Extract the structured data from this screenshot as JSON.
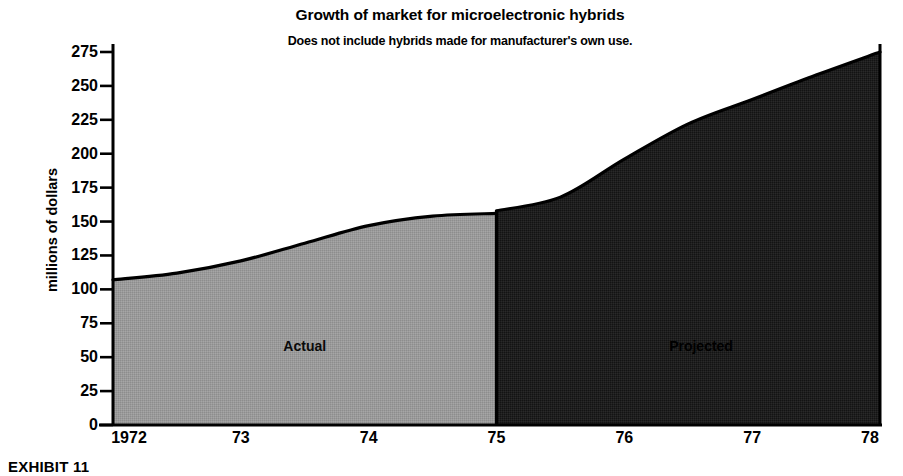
{
  "chart_data": {
    "type": "area",
    "title": "Growth of market for microelectronic hybrids",
    "subtitle": "Does not include hybrids made for manufacturer's own use.",
    "xlabel": "",
    "ylabel": "millions of dollars",
    "xlim": [
      1972,
      1978
    ],
    "ylim": [
      0,
      275
    ],
    "grid": false,
    "legend_position": "inside-plot",
    "x_tick_labels": [
      "1972",
      "73",
      "74",
      "75",
      "76",
      "77",
      "78"
    ],
    "x_tick_values": [
      1972,
      1973,
      1974,
      1975,
      1976,
      1977,
      1978
    ],
    "y_tick_labels": [
      "0",
      "25",
      "50",
      "75",
      "100",
      "125",
      "150",
      "175",
      "200",
      "225",
      "250",
      "275"
    ],
    "y_tick_values": [
      0,
      25,
      50,
      75,
      100,
      125,
      150,
      175,
      200,
      225,
      250,
      275
    ],
    "series": [
      {
        "name": "Actual",
        "fill_color": "#9a9a9a",
        "x": [
          1972,
          1972.5,
          1973,
          1973.5,
          1974,
          1974.5,
          1975
        ],
        "values": [
          107,
          112,
          121,
          134,
          147,
          154,
          156
        ]
      },
      {
        "name": "Projected",
        "fill_color": "#1e1e1e",
        "x": [
          1975,
          1975.5,
          1976,
          1976.5,
          1977,
          1977.5,
          1978
        ],
        "values": [
          158,
          168,
          196,
          222,
          240,
          258,
          275
        ]
      }
    ],
    "annotations": [
      {
        "text": "Actual",
        "x": 1973.5,
        "y": 58
      },
      {
        "text": "Projected",
        "x": 1976.6,
        "y": 58
      }
    ]
  },
  "caption": {
    "exhibit": "EXHIBIT 11"
  }
}
